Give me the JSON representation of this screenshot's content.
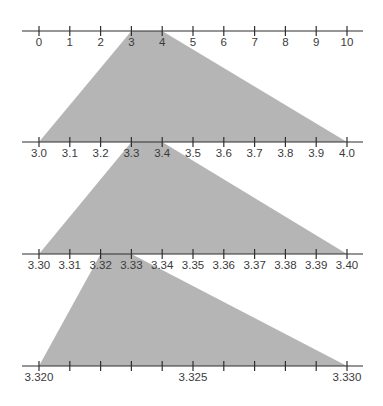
{
  "diagram": {
    "colors": {
      "line": "#2f2f2f",
      "tick": "#2f2f2f",
      "text": "#3a3a3a",
      "zoom_fill": "#b5b5b5",
      "background": "#ffffff"
    },
    "layout": {
      "x_start": 39,
      "x_end": 347,
      "line_x0": 22,
      "line_x1": 363,
      "tick_half": 5,
      "label_offset": 15
    },
    "number_lines": [
      {
        "id": "line-0-10",
        "y": 31,
        "min": 0,
        "max": 10,
        "tick_count": 11,
        "labels": [
          "0",
          "1",
          "2",
          "3",
          "4",
          "5",
          "6",
          "7",
          "8",
          "9",
          "10"
        ]
      },
      {
        "id": "line-3.0-4.0",
        "y": 142,
        "min": 3.0,
        "max": 4.0,
        "tick_count": 11,
        "labels": [
          "3.0",
          "3.1",
          "3.2",
          "3.3",
          "3.4",
          "3.5",
          "3.6",
          "3.7",
          "3.8",
          "3.9",
          "4.0"
        ]
      },
      {
        "id": "line-3.30-3.40",
        "y": 254,
        "min": 3.3,
        "max": 3.4,
        "tick_count": 11,
        "labels": [
          "3.30",
          "3.31",
          "3.32",
          "3.33",
          "3.34",
          "3.35",
          "3.36",
          "3.37",
          "3.38",
          "3.39",
          "3.40"
        ]
      },
      {
        "id": "line-3.320-3.330",
        "y": 366,
        "min": 3.32,
        "max": 3.33,
        "tick_count": 11,
        "labels": [
          "3.320",
          "",
          "",
          "",
          "",
          "3.325",
          "",
          "",
          "",
          "",
          "3.330"
        ]
      }
    ],
    "zoom_regions": [
      {
        "from_line": 0,
        "to_line": 1,
        "from_tick_start": 3,
        "from_tick_end": 4,
        "range_label": "3 to 4"
      },
      {
        "from_line": 1,
        "to_line": 2,
        "from_tick_start": 3,
        "from_tick_end": 4,
        "range_label": "3.3 to 3.4"
      },
      {
        "from_line": 2,
        "to_line": 3,
        "from_tick_start": 2,
        "from_tick_end": 3,
        "range_label": "3.32 to 3.33"
      }
    ]
  }
}
